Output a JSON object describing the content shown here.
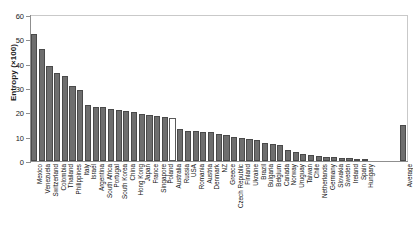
{
  "chart": {
    "type": "bar",
    "ylabel": "Entropy (×100)",
    "xlabel": "",
    "title": ""
  },
  "axis": {
    "y_ticks": [
      "0",
      "10",
      "20",
      "30",
      "40",
      "50",
      "60"
    ],
    "y_min": 0,
    "y_max": 60
  },
  "chart_data": {
    "type": "bar",
    "title": "",
    "xlabel": "",
    "ylabel": "Entropy (×100)",
    "ylim": [
      0,
      60
    ],
    "yticks": [
      0,
      10,
      20,
      30,
      40,
      50,
      60
    ],
    "grid": false,
    "legend": "none",
    "bar_color": "#6e6e6e",
    "highlight_color": "#ffffff",
    "highlighted_categories": [
      "Australia"
    ],
    "separated_categories": [
      "Average"
    ],
    "categories": [
      "Mexico",
      "Venezuela",
      "Switzerland",
      "Colombia",
      "Thailand",
      "Philippines",
      "Italy",
      "Israel",
      "Argentina",
      "South Africa",
      "Portugal",
      "South Korea",
      "China",
      "Hong Kong",
      "Japan",
      "France",
      "Singapore",
      "Poland",
      "Australia",
      "Russia",
      "USA",
      "Romania",
      "Austria",
      "Denmark",
      "NZ",
      "Greece",
      "Czech Republic",
      "Finland",
      "Ukraine",
      "Brazil",
      "Bulgaria",
      "Belgium",
      "Canada",
      "Norway",
      "Uruguay",
      "Taiwan",
      "Chile",
      "Netherlands",
      "Germany",
      "Slovakia",
      "Sweden",
      "Ireland",
      "Spain",
      "Hungary",
      "Average"
    ],
    "values": [
      52,
      46,
      39,
      36,
      35,
      31,
      29,
      23,
      22,
      22,
      21.5,
      21,
      20.5,
      20,
      19.5,
      19,
      18.5,
      18,
      17.5,
      13,
      12.5,
      12.5,
      12,
      12,
      11,
      10.5,
      10,
      9.5,
      9,
      8.5,
      7.5,
      7,
      6.5,
      4.5,
      3.5,
      3,
      2.5,
      2,
      1.8,
      1.6,
      1.4,
      1.2,
      1,
      0.8,
      15
    ]
  }
}
